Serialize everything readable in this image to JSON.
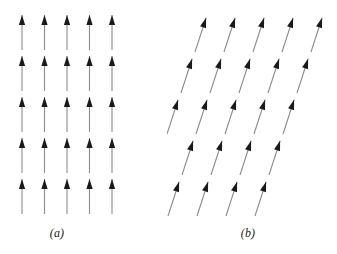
{
  "figure": {
    "background_color": "#ffffff",
    "width": 337,
    "height": 254,
    "shaft_color": "#8c8c8c",
    "head_color": "#1a1a1a"
  },
  "panels": [
    {
      "id": "panel-a",
      "caption": "(a)",
      "description": "rectangular lattice of vertical arrows",
      "rows": 5,
      "cols": 5,
      "arrow_angle_deg": 0,
      "col_spacing": 22.5,
      "row_spacing": 41,
      "row_shift": 0,
      "origin_x": 22,
      "origin_y": 50,
      "arrow_length": 35
    },
    {
      "id": "panel-b",
      "caption": "(b)",
      "description": "sheared oblique lattice of tilted arrows",
      "rows": 5,
      "cols": 5,
      "arrow_angle_deg": 18,
      "col_spacing": 29,
      "row_spacing": 41,
      "row_shift": -14,
      "origin_x": 28,
      "origin_y": 52,
      "arrow_length": 36
    }
  ],
  "chart_data": {
    "type": "scatter",
    "title": "",
    "xlabel": "",
    "ylabel": "",
    "legend": [],
    "grid": false,
    "series": [
      {
        "name": "(a) vertical spin lattice",
        "arrow_angle_deg": 0,
        "x": [
          22,
          44.5,
          67,
          89.5,
          112,
          22,
          44.5,
          67,
          89.5,
          112,
          22,
          44.5,
          67,
          89.5,
          112,
          22,
          44.5,
          67,
          89.5,
          112,
          22,
          44.5,
          67,
          89.5,
          112
        ],
        "y": [
          50,
          50,
          50,
          50,
          50,
          91,
          91,
          91,
          91,
          91,
          132,
          132,
          132,
          132,
          132,
          173,
          173,
          173,
          173,
          173,
          214,
          214,
          214,
          214,
          214
        ]
      },
      {
        "name": "(b) sheared spin lattice",
        "arrow_angle_deg": 18,
        "x": [
          84,
          113,
          142,
          171,
          200,
          70,
          99,
          128,
          157,
          186,
          56,
          85,
          114,
          143,
          172,
          42,
          71,
          100,
          129,
          158,
          28,
          57,
          86,
          115,
          144
        ],
        "y": [
          52,
          52,
          52,
          52,
          52,
          93,
          93,
          93,
          93,
          93,
          134,
          134,
          134,
          134,
          134,
          175,
          175,
          175,
          175,
          175,
          216,
          216,
          216,
          216,
          216
        ]
      }
    ]
  }
}
